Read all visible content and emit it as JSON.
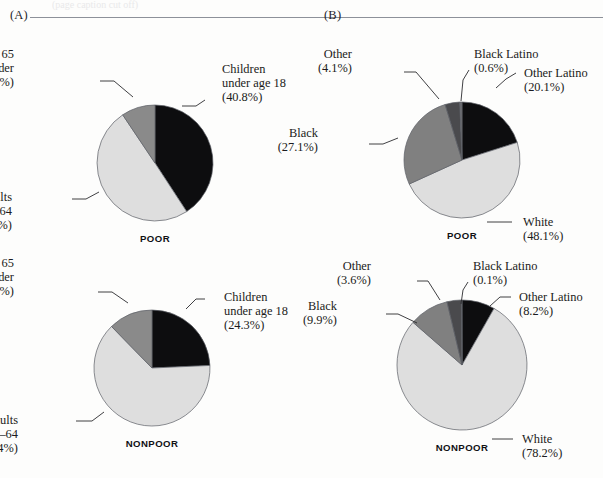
{
  "figure": {
    "cut_caption": "(page caption cut off)",
    "panels": [
      {
        "letter": "(A)",
        "charts": [
          {
            "group_name": "POOR",
            "center": [
              155,
              163
            ],
            "radius": 58,
            "start_angle": 0,
            "slices": [
              {
                "label": "Children\nunder age 18",
                "name": "Children under age 18",
                "pct": "(40.8%)",
                "value": 40.8,
                "color": "#0d0d0f",
                "align": "l",
                "lx": 222,
                "ly": 62,
                "leader": [
                  [
                    205,
                    100
                  ],
                  [
                    196,
                    106
                  ],
                  [
                    182,
                    106
                  ]
                ]
              },
              {
                "label": "Adults\nages 18–64",
                "name": "Adults ages 18–64",
                "pct": "(49.8%)",
                "value": 49.8,
                "color": "#dedede",
                "align": "r",
                "lx": 12,
                "ly": 190,
                "leader": [
                  [
                    72,
                    199
                  ],
                  [
                    86,
                    199
                  ],
                  [
                    99,
                    192
                  ]
                ]
              },
              {
                "label": "Adults ages 65\nand older",
                "name": "Adults ages 65 and older",
                "pct": "(9.4%)",
                "value": 9.4,
                "color": "#8a8a8a",
                "align": "r",
                "lx": 14,
                "ly": 47,
                "leader": [
                  [
                    100,
                    81
                  ],
                  [
                    114,
                    81
                  ],
                  [
                    133,
                    97
                  ]
                ]
              }
            ]
          },
          {
            "group_name": "NONPOOR",
            "center": [
              152,
              368
            ],
            "radius": 58,
            "start_angle": 0,
            "slices": [
              {
                "label": "Children\nunder age 18",
                "name": "Children under age 18",
                "pct": "(24.3%)",
                "value": 24.3,
                "color": "#0d0d0f",
                "align": "l",
                "lx": 224,
                "ly": 290,
                "leader": [
                  [
                    205,
                    299
                  ],
                  [
                    196,
                    299
                  ],
                  [
                    186,
                    309
                  ]
                ]
              },
              {
                "label": "Adults\nages 18–64",
                "name": "Adults ages 18–64",
                "pct": "(63.4%)",
                "value": 63.4,
                "color": "#dedede",
                "align": "r",
                "lx": 18,
                "ly": 413,
                "leader": [
                  [
                    76,
                    421
                  ],
                  [
                    92,
                    421
                  ],
                  [
                    104,
                    412
                  ]
                ]
              },
              {
                "label": "Adults ages 65\nand older",
                "name": "Adults ages 65 and older",
                "pct": "(12.3%)",
                "value": 12.3,
                "color": "#8a8a8a",
                "align": "r",
                "lx": 14,
                "ly": 256,
                "leader": [
                  [
                    98,
                    292
                  ],
                  [
                    112,
                    292
                  ],
                  [
                    128,
                    303
                  ]
                ]
              }
            ]
          }
        ]
      },
      {
        "letter": "(B)",
        "charts": [
          {
            "group_name": "POOR",
            "center": [
              462,
              160
            ],
            "radius": 58,
            "start_angle": 0,
            "slices": [
              {
                "label": "Other Latino",
                "name": "Other Latino",
                "pct": "(20.1%)",
                "value": 20.1,
                "color": "#0d0d0f",
                "align": "l",
                "lx": 524,
                "ly": 66,
                "leader": [
                  [
                    516,
                    73
                  ],
                  [
                    506,
                    79
                  ],
                  [
                    496,
                    88
                  ]
                ]
              },
              {
                "label": "White",
                "name": "White",
                "pct": "(48.1%)",
                "value": 48.1,
                "color": "#dedede",
                "align": "l",
                "lx": 523,
                "ly": 215,
                "leader": [
                  [
                    487,
                    222
                  ],
                  [
                    500,
                    222
                  ],
                  [
                    512,
                    222
                  ]
                ]
              },
              {
                "label": "Black",
                "name": "Black",
                "pct": "(27.1%)",
                "value": 27.1,
                "color": "#808080",
                "align": "r",
                "lx": 318,
                "ly": 126,
                "leader": [
                  [
                    369,
                    144
                  ],
                  [
                    383,
                    144
                  ],
                  [
                    398,
                    138
                  ]
                ]
              },
              {
                "label": "Other",
                "name": "Other",
                "pct": "(4.1%)",
                "value": 4.1,
                "color": "#4a4a4d",
                "align": "r",
                "lx": 352,
                "ly": 47,
                "leader": [
                  [
                    404,
                    72
                  ],
                  [
                    416,
                    72
                  ],
                  [
                    439,
                    99
                  ]
                ]
              },
              {
                "label": "Black Latino",
                "name": "Black Latino",
                "pct": "(0.6%)",
                "value": 0.6,
                "color": "#6e6e72",
                "align": "l",
                "lx": 474,
                "ly": 47,
                "leader": [
                  [
                    469,
                    70
                  ],
                  [
                    463,
                    80
                  ],
                  [
                    461,
                    101
                  ]
                ]
              }
            ]
          },
          {
            "group_name": "NONPOOR",
            "center": [
              462,
              365
            ],
            "radius": 65,
            "start_angle": 0,
            "slices": [
              {
                "label": "Other Latino",
                "name": "Other Latino",
                "pct": "(8.2%)",
                "value": 8.2,
                "color": "#0d0d0f",
                "align": "l",
                "lx": 519,
                "ly": 290,
                "leader": [
                  [
                    511,
                    297
                  ],
                  [
                    500,
                    297
                  ],
                  [
                    490,
                    306
                  ]
                ]
              },
              {
                "label": "White",
                "name": "White",
                "pct": "(78.2%)",
                "value": 78.2,
                "color": "#dedede",
                "align": "l",
                "lx": 522,
                "ly": 432,
                "leader": [
                  [
                    492,
                    439
                  ],
                  [
                    504,
                    439
                  ],
                  [
                    513,
                    439
                  ]
                ]
              },
              {
                "label": "Black",
                "name": "Black",
                "pct": "(9.9%)",
                "value": 9.9,
                "color": "#808080",
                "align": "r",
                "lx": 337,
                "ly": 299,
                "leader": [
                  [
                    386,
                    314
                  ],
                  [
                    398,
                    314
                  ],
                  [
                    417,
                    323
                  ]
                ]
              },
              {
                "label": "Other",
                "name": "Other",
                "pct": "(3.6%)",
                "value": 3.6,
                "color": "#4a4a4d",
                "align": "r",
                "lx": 371,
                "ly": 259,
                "leader": [
                  [
                    417,
                    281
                  ],
                  [
                    428,
                    281
                  ],
                  [
                    440,
                    300
                  ]
                ]
              },
              {
                "label": "Black Latino",
                "name": "Black Latino",
                "pct": "(0.1%)",
                "value": 0.1,
                "color": "#6e6e72",
                "align": "l",
                "lx": 473,
                "ly": 259,
                "leader": [
                  [
                    468,
                    282
                  ],
                  [
                    463,
                    290
                  ],
                  [
                    461,
                    304
                  ]
                ]
              }
            ]
          }
        ]
      }
    ]
  },
  "chart_data": [
    {
      "type": "pie",
      "title": "(A) POOR — age distribution",
      "panel": "(A)",
      "group": "POOR",
      "categories": [
        "Children under age 18",
        "Adults ages 18–64",
        "Adults ages 65 and older"
      ],
      "values": [
        40.8,
        49.8,
        9.4
      ],
      "unit": "percent",
      "colors": [
        "#0d0d0f",
        "#dedede",
        "#8a8a8a"
      ],
      "legend": "callout-labels-with-leader-lines",
      "grid": false
    },
    {
      "type": "pie",
      "title": "(A) NONPOOR — age distribution",
      "panel": "(A)",
      "group": "NONPOOR",
      "categories": [
        "Children under age 18",
        "Adults ages 18–64",
        "Adults ages 65 and older"
      ],
      "values": [
        24.3,
        63.4,
        12.3
      ],
      "unit": "percent",
      "colors": [
        "#0d0d0f",
        "#dedede",
        "#8a8a8a"
      ],
      "legend": "callout-labels-with-leader-lines",
      "grid": false
    },
    {
      "type": "pie",
      "title": "(B) POOR — race/ethnicity distribution",
      "panel": "(B)",
      "group": "POOR",
      "categories": [
        "Other Latino",
        "White",
        "Black",
        "Other",
        "Black Latino"
      ],
      "values": [
        20.1,
        48.1,
        27.1,
        4.1,
        0.6
      ],
      "unit": "percent",
      "colors": [
        "#0d0d0f",
        "#dedede",
        "#808080",
        "#4a4a4d",
        "#6e6e72"
      ],
      "legend": "callout-labels-with-leader-lines",
      "grid": false
    },
    {
      "type": "pie",
      "title": "(B) NONPOOR — race/ethnicity distribution",
      "panel": "(B)",
      "group": "NONPOOR",
      "categories": [
        "Other Latino",
        "White",
        "Black",
        "Other",
        "Black Latino"
      ],
      "values": [
        8.2,
        78.2,
        9.9,
        3.6,
        0.1
      ],
      "unit": "percent",
      "colors": [
        "#0d0d0f",
        "#dedede",
        "#808080",
        "#4a4a4d",
        "#6e6e72"
      ],
      "legend": "callout-labels-with-leader-lines",
      "grid": false
    }
  ]
}
